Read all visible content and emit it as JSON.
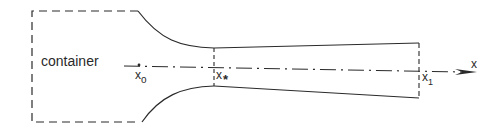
{
  "diagram": {
    "type": "nozzle-flow-schematic",
    "labels": {
      "container": "container",
      "x0_base": "x",
      "x0_sub": "o",
      "xstar_base": "x",
      "xstar_sub": "*",
      "x1_base": "x",
      "x1_sub": "1",
      "axis": "x"
    },
    "colors": {
      "stroke": "#2a2a2a",
      "background": "#ffffff"
    }
  }
}
